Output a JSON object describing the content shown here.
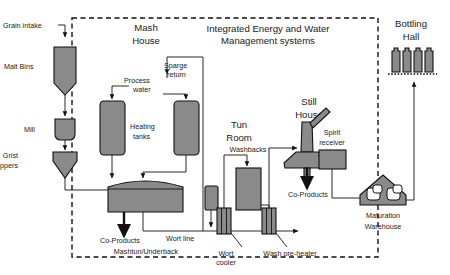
{
  "diagram": {
    "title": "Integrated Energy and Water Management systems",
    "boundary_label": "Integrated Energy and Water Management systems",
    "zones": [
      {
        "id": "mash-house",
        "label_line1": "Mash",
        "label_line2": "House"
      },
      {
        "id": "tun-room",
        "label_line1": "Tun",
        "label_line2": "Room"
      },
      {
        "id": "still-house",
        "label_line1": "Still",
        "label_line2": "House"
      },
      {
        "id": "bottling-hall",
        "label_line1": "Bottling",
        "label_line2": "Hall"
      }
    ],
    "nodes": [
      {
        "id": "grain-intake",
        "label": "Grain intake"
      },
      {
        "id": "malt-bins",
        "label": "Malt Bins"
      },
      {
        "id": "mill",
        "label": "Mill"
      },
      {
        "id": "grist-hoppers",
        "label_line1": "Grist",
        "label_line2": "Hoppers"
      },
      {
        "id": "process-water",
        "label_line1": "Process",
        "label_line2": "water"
      },
      {
        "id": "sparge-return",
        "label_line1": "Sparge",
        "label_line2": "return"
      },
      {
        "id": "heating-tanks",
        "label_line1": "Heating",
        "label_line2": "tanks"
      },
      {
        "id": "mashtun-underback",
        "label": "Mashtun/Underback"
      },
      {
        "id": "co-products-mash",
        "label": "Co-Products"
      },
      {
        "id": "wort-line",
        "label": "Wort line"
      },
      {
        "id": "wort-cooler",
        "label_line1": "Wort",
        "label_line2": "cooler"
      },
      {
        "id": "washbacks",
        "label": "Washbacks"
      },
      {
        "id": "wash-pre-heater",
        "label": "Wash pre-heater"
      },
      {
        "id": "spirit-receiver",
        "label_line1": "Spirit",
        "label_line2": "receiver"
      },
      {
        "id": "co-products-still",
        "label": "Co-Products"
      },
      {
        "id": "maturation-warehouse",
        "label_line1": "Maturation",
        "label_line2": "Warehouse"
      }
    ],
    "colors": {
      "vessel_fill": "#8a8a8a",
      "stroke": "#111111",
      "background": "#ffffff",
      "text": "#1a1a1a"
    }
  }
}
